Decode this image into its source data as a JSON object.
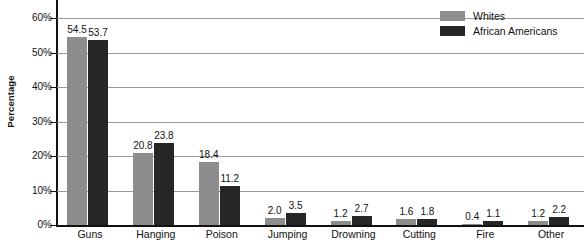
{
  "chart_data": {
    "type": "bar",
    "title": "",
    "subtitle": "",
    "xlabel": "",
    "ylabel": "Percentage",
    "ylim": [
      0,
      60
    ],
    "ytick_labels": [
      "0%",
      "10%",
      "20%",
      "30%",
      "40%",
      "50%",
      "60%"
    ],
    "ytick_values": [
      0,
      10,
      20,
      30,
      40,
      50,
      60
    ],
    "grid": true,
    "legend_position": "top-right",
    "categories": [
      "Guns",
      "Hanging",
      "Poison",
      "Jumping",
      "Drowning",
      "Cutting",
      "Fire",
      "Other"
    ],
    "series": [
      {
        "name": "Whites",
        "color": "#8d8d8d",
        "values": [
          54.5,
          20.8,
          18.4,
          2.0,
          1.2,
          1.6,
          0.4,
          1.2
        ],
        "labels": [
          "54.5",
          "20.8",
          "18.4",
          "2.0",
          "1.2",
          "1.6",
          "0.4",
          "1.2"
        ]
      },
      {
        "name": "African Americans",
        "color": "#262626",
        "values": [
          53.7,
          23.8,
          11.2,
          3.5,
          2.7,
          1.8,
          1.1,
          2.2
        ],
        "labels": [
          "53.7",
          "23.8",
          "11.2",
          "3.5",
          "2.7",
          "1.8",
          "1.1",
          "2.2"
        ]
      }
    ]
  }
}
